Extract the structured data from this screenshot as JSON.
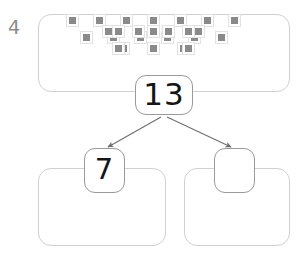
{
  "worksheet": {
    "problem_number": "4",
    "problem_number_color": "#8c8c8c"
  },
  "number_bond": {
    "total": {
      "label": "13",
      "box_name": "total-bond-box",
      "is_blank": false
    },
    "parts": [
      {
        "label": "7",
        "box_name": "left-part-bond-box",
        "is_blank": false
      },
      {
        "label": "",
        "box_name": "right-part-bond-box",
        "is_blank": true
      }
    ],
    "arrow_count": 2,
    "arrow_color": "#6e6e6e",
    "box_border_color": "#9a9a9a"
  },
  "counter_groups": {
    "total": {
      "name": "total-counter-group",
      "count": 13,
      "rows": [
        7,
        6
      ]
    },
    "part_left": {
      "name": "left-part-counter-group",
      "count": 7,
      "rows": [
        4,
        3
      ]
    },
    "part_right": {
      "name": "right-part-counter-group",
      "count": 6,
      "rows": [
        3,
        3
      ]
    },
    "counter_fill_color": "#8a8a8a",
    "counter_frame_color": "#e2e2e2",
    "group_border_color": "#d0d0d0"
  }
}
